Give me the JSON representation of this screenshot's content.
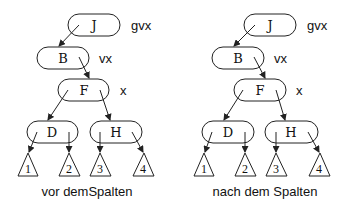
{
  "diagrams": [
    {
      "id": "left",
      "caption": "vor demSpalten",
      "nodes": {
        "J": "J",
        "B": "B",
        "F": "F",
        "D": "D",
        "H": "H"
      },
      "side_labels": {
        "gvx": "gvx",
        "vx": "vx",
        "x": "x"
      },
      "subtrees": [
        "1",
        "2",
        "3",
        "4"
      ]
    },
    {
      "id": "right",
      "caption": "nach dem Spalten",
      "nodes": {
        "J": "J",
        "B": "B",
        "F": "F",
        "D": "D",
        "H": "H"
      },
      "side_labels": {
        "gvx": "gvx",
        "vx": "vx",
        "x": "x"
      },
      "subtrees": [
        "1",
        "2",
        "3",
        "4"
      ]
    }
  ]
}
